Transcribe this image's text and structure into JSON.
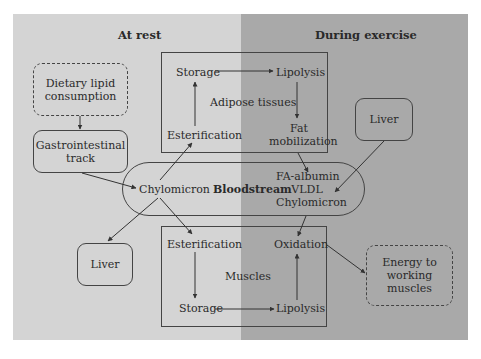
{
  "headers": {
    "left": "At rest",
    "right": "During exercise"
  },
  "colors": {
    "rest_bg": "#d4d4d4",
    "exercise_bg": "#a9a9a9",
    "line": "#444444"
  },
  "nodes": {
    "dietary": "Dietary lipid consumption",
    "gi": "Gastrointestinal track",
    "liver_left": "Liver",
    "liver_right": "Liver",
    "energy": "Energy to working muscles",
    "bloodstream": {
      "label": "Bloodstream",
      "rest_item": "Chylomicron",
      "exercise_items": [
        "FA-albumin",
        "VLDL",
        "Chylomicron"
      ]
    },
    "adipose": {
      "label": "Adipose tissues",
      "storage": "Storage",
      "lipolysis": "Lipolysis",
      "esterification": "Esterification",
      "fat_mobilization": [
        "Fat",
        "mobilization"
      ]
    },
    "muscles": {
      "label": "Muscles",
      "esterification": "Esterification",
      "oxidation": "Oxidation",
      "storage": "Storage",
      "lipolysis": "Lipolysis"
    }
  },
  "edges": [
    [
      "Dietary lipid consumption",
      "Gastrointestinal track"
    ],
    [
      "Gastrointestinal track",
      "Chylomicron"
    ],
    [
      "Chylomicron",
      "Adipose Esterification"
    ],
    [
      "Chylomicron",
      "Liver (rest)"
    ],
    [
      "Chylomicron",
      "Muscle Esterification"
    ],
    [
      "Adipose Esterification",
      "Adipose Storage"
    ],
    [
      "Adipose Storage",
      "Adipose Lipolysis"
    ],
    [
      "Adipose Lipolysis",
      "Fat mobilization"
    ],
    [
      "Fat mobilization",
      "FA-albumin"
    ],
    [
      "Liver (exercise)",
      "VLDL"
    ],
    [
      "Bloodstream Chylomicron (exercise)",
      "Oxidation"
    ],
    [
      "Muscle Esterification",
      "Muscle Storage"
    ],
    [
      "Muscle Storage",
      "Muscle Lipolysis"
    ],
    [
      "Muscle Lipolysis",
      "Oxidation"
    ],
    [
      "Oxidation",
      "Energy to working muscles"
    ]
  ]
}
